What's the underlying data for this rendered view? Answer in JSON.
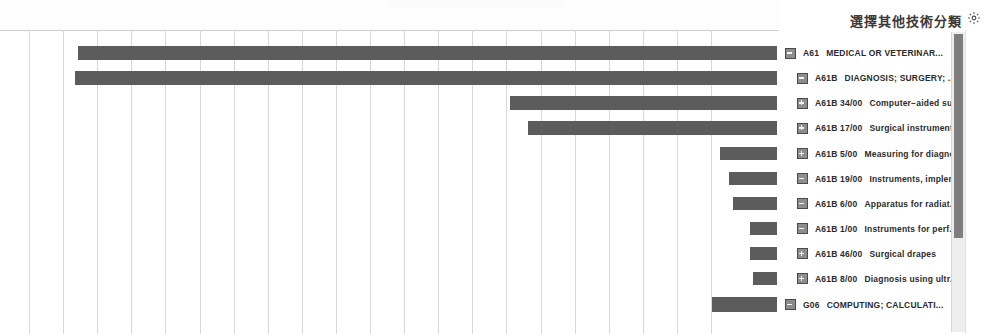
{
  "panel": {
    "title": "選擇其他技術分類",
    "gear_icon": "gear-icon",
    "scrollbar": {
      "orientation": "vertical",
      "thumb_fraction": 0.69
    }
  },
  "legend": {
    "items": [
      {
        "expander": "minus",
        "level": 0,
        "code": "A61",
        "label": "MEDICAL OR VETERINAR..."
      },
      {
        "expander": "minus",
        "level": 1,
        "code": "A61B",
        "label": "DIAGNOSIS; SURGERY; ..."
      },
      {
        "expander": "plus",
        "level": 1,
        "code": "A61B 34/00",
        "label": "Computer−aided surge..."
      },
      {
        "expander": "plus",
        "level": 1,
        "code": "A61B 17/00",
        "label": "Surgical instruments..."
      },
      {
        "expander": "plus",
        "level": 1,
        "code": "A61B 5/00",
        "label": "Measuring for diagno..."
      },
      {
        "expander": "minus",
        "level": 1,
        "code": "A61B 19/00",
        "label": "Instruments, impleme..."
      },
      {
        "expander": "minus",
        "level": 1,
        "code": "A61B 6/00",
        "label": "Apparatus for radiat..."
      },
      {
        "expander": "minus",
        "level": 1,
        "code": "A61B 1/00",
        "label": "Instruments for perf..."
      },
      {
        "expander": "plus",
        "level": 1,
        "code": "A61B 46/00",
        "label": "Surgical drapes"
      },
      {
        "expander": "plus",
        "level": 1,
        "code": "A61B 8/00",
        "label": "Diagnosis using ultr..."
      },
      {
        "expander": "minus",
        "level": 0,
        "code": "G06",
        "label": "COMPUTING; CALCULATI..."
      }
    ]
  },
  "chart_data": {
    "type": "bar",
    "orientation": "horizontal",
    "title": "",
    "xlabel": "",
    "ylabel": "",
    "grid": true,
    "gridline_count": 21,
    "bar_color": "#5c5c5c",
    "note": "Bars are right-aligned; value labels printed inside bars are illegible in the scan.",
    "categories": [
      "A61  MEDICAL OR VETERINAR...",
      "A61B  DIAGNOSIS; SURGERY; ...",
      "A61B 34/00  Computer−aided surge...",
      "A61B 17/00  Surgical instruments...",
      "A61B 5/00  Measuring for diagno...",
      "A61B 19/00  Instruments, impleme...",
      "A61B 6/00  Apparatus for radiat...",
      "A61B 1/00  Instruments for perf...",
      "A61B 46/00  Surgical drapes",
      "A61B 8/00  Diagnosis using ultr...",
      "G06  COMPUTING; CALCULATI..."
    ],
    "values": [
      699,
      702,
      267,
      249,
      57,
      48,
      44,
      27,
      27,
      24,
      65
    ],
    "labels": [
      "",
      "",
      "",
      "",
      "",
      "",
      "",
      "",
      "",
      "",
      ""
    ],
    "bar_geometry": [
      {
        "left": 78,
        "right": 777,
        "top": 46,
        "height": 14
      },
      {
        "left": 75,
        "right": 777,
        "top": 71,
        "height": 14
      },
      {
        "left": 510,
        "right": 777,
        "top": 96,
        "height": 14
      },
      {
        "left": 528,
        "right": 777,
        "top": 121,
        "height": 14
      },
      {
        "left": 720,
        "right": 777,
        "top": 147,
        "height": 13
      },
      {
        "left": 729,
        "right": 777,
        "top": 172,
        "height": 13
      },
      {
        "left": 733,
        "right": 777,
        "top": 197,
        "height": 13
      },
      {
        "left": 750,
        "right": 777,
        "top": 222,
        "height": 13
      },
      {
        "left": 750,
        "right": 777,
        "top": 247,
        "height": 13
      },
      {
        "left": 753,
        "right": 777,
        "top": 272,
        "height": 13
      },
      {
        "left": 712,
        "right": 777,
        "top": 297,
        "height": 15
      }
    ]
  }
}
